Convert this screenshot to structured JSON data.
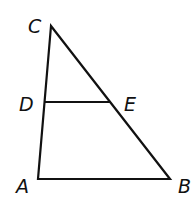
{
  "diagram": {
    "type": "triangle with segment",
    "stroke_color": "#111111",
    "points": {
      "C": {
        "label": "C",
        "x": 51,
        "y": 26
      },
      "A": {
        "label": "A",
        "x": 38,
        "y": 179
      },
      "B": {
        "label": "B",
        "x": 170,
        "y": 179
      },
      "D": {
        "label": "D",
        "x": 44,
        "y": 102
      },
      "E": {
        "label": "E",
        "x": 110,
        "y": 102
      }
    },
    "segments": [
      "CA",
      "AB",
      "BC",
      "DE"
    ],
    "labels": {
      "C": "C",
      "D": "D",
      "E": "E",
      "A": "A",
      "B": "B"
    }
  }
}
